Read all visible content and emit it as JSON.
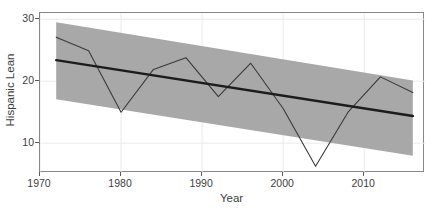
{
  "chart_data": {
    "type": "line",
    "title": "",
    "subtitle": "",
    "xlabel": "Year",
    "ylabel": "Hispanic Lean",
    "xlim": [
      1970,
      2017.5
    ],
    "ylim": [
      5.2,
      31.0
    ],
    "xticks": [
      1970,
      1980,
      1990,
      2000,
      2010
    ],
    "xticklabels": [
      "1970",
      "1980",
      "1990",
      "2000",
      "2010"
    ],
    "yticks": [
      10,
      20,
      30
    ],
    "yticklabels": [
      "10",
      "20",
      "30"
    ],
    "grid": true,
    "grid_color": "#eaeaea",
    "legend": "none",
    "background": "#ffffff",
    "panel_border_color": "#878787",
    "x": [
      1972,
      1976,
      1980,
      1984,
      1988,
      1992,
      1996,
      2000,
      2004,
      2008,
      2012,
      2016
    ],
    "series": [
      {
        "name": "Hispanic Lean",
        "type": "line",
        "color": "#3a3a3a",
        "linewidth": 1.1,
        "values": [
          27.1,
          24.9,
          15.0,
          21.9,
          23.8,
          17.5,
          22.9,
          15.6,
          6.3,
          15.0,
          20.7,
          18.2
        ]
      },
      {
        "name": "Linear trend",
        "type": "line",
        "color": "#1c1c1c",
        "linewidth": 2.4,
        "x": [
          1972,
          2016
        ],
        "values": [
          23.4,
          14.4
        ]
      }
    ],
    "ribbon": {
      "name": "Confidence interval",
      "color": "#a8a8a8",
      "x": [
        1972,
        2016
      ],
      "upper": [
        29.5,
        20.1
      ],
      "lower": [
        17.1,
        8.0
      ]
    },
    "annotations": []
  }
}
